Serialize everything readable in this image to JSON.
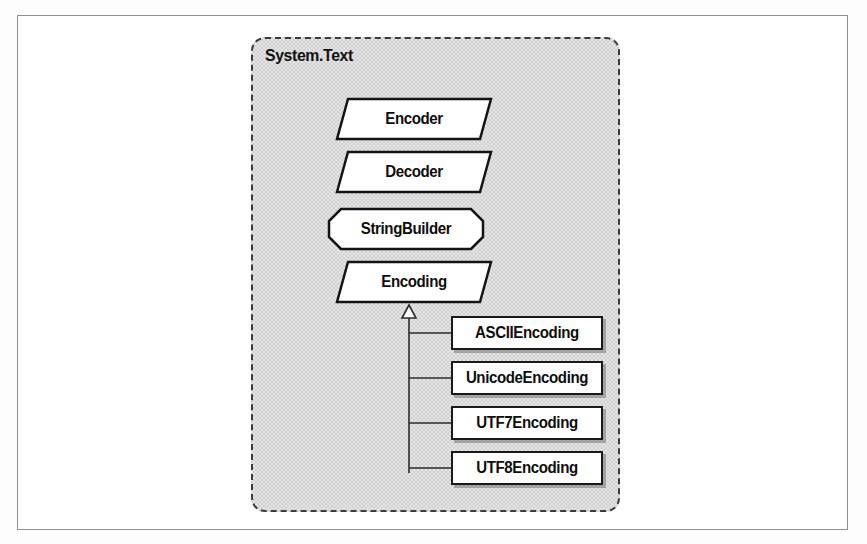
{
  "figure": {
    "kind": "uml-package-diagram",
    "frame_border_color": "#8e9095",
    "canvas_background": "#ffffff"
  },
  "package": {
    "name": "System.Text",
    "fill_color": "#cdcdcd",
    "border_color": "#3b3b3b",
    "border_style": "dashed"
  },
  "nodes": [
    {
      "id": "encoder",
      "label": "Encoder",
      "shape": "parallelogram",
      "stereotype": "abstract-class",
      "x": 334,
      "y": 96,
      "w": 154,
      "h": 40
    },
    {
      "id": "decoder",
      "label": "Decoder",
      "shape": "parallelogram",
      "stereotype": "abstract-class",
      "x": 334,
      "y": 149,
      "w": 154,
      "h": 40
    },
    {
      "id": "stringbuilder",
      "label": "StringBuilder",
      "shape": "octagon",
      "stereotype": "sealed-class",
      "x": 326,
      "y": 206,
      "w": 154,
      "h": 40
    },
    {
      "id": "encoding",
      "label": "Encoding",
      "shape": "parallelogram",
      "stereotype": "abstract-class",
      "x": 334,
      "y": 259,
      "w": 154,
      "h": 40
    },
    {
      "id": "asciiencoding",
      "label": "ASCIIEncoding",
      "shape": "rectangle",
      "stereotype": "class",
      "x": 448,
      "y": 313,
      "w": 152,
      "h": 34
    },
    {
      "id": "unicodeencoding",
      "label": "UnicodeEncoding",
      "shape": "rectangle",
      "stereotype": "class",
      "x": 448,
      "y": 358,
      "w": 152,
      "h": 34
    },
    {
      "id": "utf7encoding",
      "label": "UTF7Encoding",
      "shape": "rectangle",
      "stereotype": "class",
      "x": 448,
      "y": 403,
      "w": 152,
      "h": 34
    },
    {
      "id": "utf8encoding",
      "label": "UTF8Encoding",
      "shape": "rectangle",
      "stereotype": "class",
      "x": 448,
      "y": 448,
      "w": 152,
      "h": 34
    }
  ],
  "relationships": [
    {
      "type": "inheritance",
      "from": "asciiencoding",
      "to": "encoding",
      "marker": "hollow-triangle"
    },
    {
      "type": "inheritance",
      "from": "unicodeencoding",
      "to": "encoding",
      "marker": "hollow-triangle"
    },
    {
      "type": "inheritance",
      "from": "utf7encoding",
      "to": "encoding",
      "marker": "hollow-triangle"
    },
    {
      "type": "inheritance",
      "from": "utf8encoding",
      "to": "encoding",
      "marker": "hollow-triangle"
    }
  ]
}
